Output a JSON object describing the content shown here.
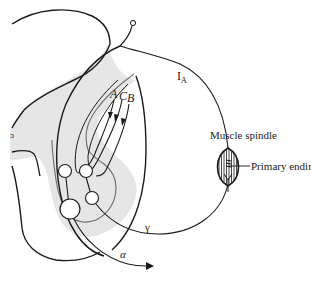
{
  "diagram": {
    "labels": {
      "ia_fiber": "I",
      "ia_subscript": "A",
      "pathway_a": "A",
      "pathway_c": "C",
      "pathway_b": "B",
      "muscle_spindle": "Muscle spindle",
      "primary_ending": "Primary ending",
      "gamma": "γ",
      "alpha": "α"
    },
    "colors": {
      "line": "#1a1a1a",
      "grey_matter": "#e6e6e6",
      "background": "#ffffff"
    }
  }
}
